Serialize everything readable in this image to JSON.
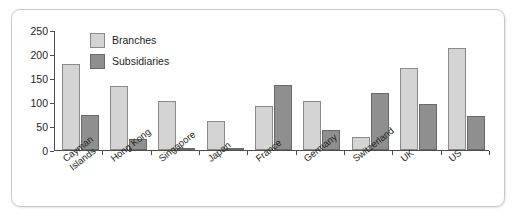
{
  "chart_data": {
    "type": "bar",
    "title": "",
    "subtitle": "",
    "xlabel": "",
    "ylabel": "",
    "ylim": [
      0,
      250
    ],
    "yticks": [
      0,
      50,
      100,
      150,
      200,
      250
    ],
    "grid": false,
    "legend_position": "inside-top-left",
    "categories": [
      "Cayman Islands",
      "Hong Kong",
      "Singapore",
      "Japan",
      "France",
      "Germany",
      "Switzerland",
      "UK",
      "US"
    ],
    "category_lines": [
      [
        "Cayman",
        "Islands"
      ],
      [
        "Hong Kong",
        ""
      ],
      [
        "Singapore",
        ""
      ],
      [
        "Japan",
        ""
      ],
      [
        "France",
        ""
      ],
      [
        "Germany",
        ""
      ],
      [
        "Switzerland",
        ""
      ],
      [
        "UK",
        ""
      ],
      [
        "US",
        ""
      ]
    ],
    "series": [
      {
        "name": "Branches",
        "color": "#d4d4d4",
        "values": [
          180,
          133,
          103,
          60,
          92,
          102,
          28,
          170,
          212
        ]
      },
      {
        "name": "Subsidiaries",
        "color": "#8f8f8f",
        "values": [
          73,
          22,
          2,
          2,
          135,
          42,
          118,
          95,
          70
        ]
      }
    ]
  },
  "legend": {
    "items": [
      {
        "label": "Branches",
        "swatch": "branches"
      },
      {
        "label": "Subsidiaries",
        "swatch": "subsidiaries"
      }
    ]
  }
}
